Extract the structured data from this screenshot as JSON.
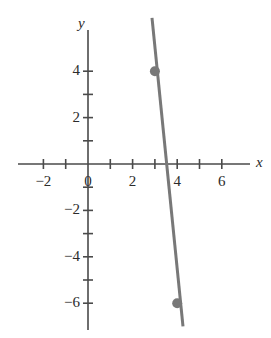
{
  "figure": {
    "width": 271,
    "height": 338,
    "background": "#ffffff"
  },
  "axes": {
    "x_label": "x",
    "y_label": "y",
    "axis_color": "#4a4a4a",
    "label_color": "#2b2b2b",
    "origin_px": {
      "x": 88,
      "y": 164
    },
    "unit_px": {
      "x": 22.3,
      "y": 23.2
    },
    "x_axis_span_px": {
      "start": 18,
      "end": 250
    },
    "y_axis_span_px": {
      "start": 30,
      "end": 330
    },
    "xlim": [
      -3.1,
      7.3
    ],
    "ylim": [
      -7.2,
      5.8
    ],
    "x_ticks": [
      -2,
      -1,
      1,
      2,
      3,
      4,
      5,
      6
    ],
    "y_ticks": [
      1,
      2,
      3,
      4,
      -1,
      -2,
      -3,
      -4,
      -5,
      -6
    ],
    "x_tick_labels": [
      {
        "value": -2,
        "text": "−2"
      },
      {
        "value": 0,
        "text": "0"
      },
      {
        "value": 2,
        "text": "2"
      },
      {
        "value": 4,
        "text": "4"
      },
      {
        "value": 6,
        "text": "6"
      }
    ],
    "y_tick_labels": [
      {
        "value": 4,
        "text": "4"
      },
      {
        "value": 2,
        "text": "2"
      },
      {
        "value": -2,
        "text": "−2"
      },
      {
        "value": -4,
        "text": "−4"
      },
      {
        "value": -6,
        "text": "−6"
      }
    ],
    "grid": false
  },
  "chart_data": {
    "type": "line",
    "title": "",
    "xlabel": "x",
    "ylabel": "y",
    "xlim": [
      -3.1,
      7.3
    ],
    "ylim": [
      -7.2,
      5.8
    ],
    "grid": false,
    "legend": "none",
    "series": [
      {
        "name": "line",
        "color": "#787878",
        "line_width_px": 3,
        "x": [
          2.87,
          4.26
        ],
        "y": [
          6.3,
          -7.0
        ],
        "slope": -10,
        "through_points": [
          [
            3,
            4
          ],
          [
            4,
            -6
          ]
        ],
        "x_intercept": 3.4
      }
    ],
    "points": [
      {
        "label": "",
        "x": 3,
        "y": 4,
        "color": "#787878",
        "radius_px": 5
      },
      {
        "label": "",
        "x": 4,
        "y": -6,
        "color": "#787878",
        "radius_px": 5
      }
    ],
    "x_tick_values": [
      -2,
      -1,
      1,
      2,
      3,
      4,
      5,
      6
    ],
    "y_tick_values": [
      4,
      3,
      2,
      1,
      -1,
      -2,
      -3,
      -4,
      -5,
      -6
    ],
    "x_tick_text": [
      "-2",
      "0",
      "2",
      "4",
      "6"
    ],
    "y_tick_text": [
      "4",
      "2",
      "-2",
      "-4",
      "-6"
    ]
  }
}
